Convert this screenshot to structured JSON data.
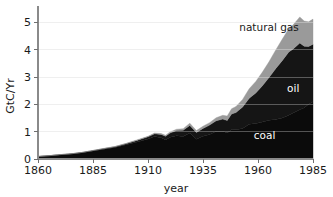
{
  "chart_data": {
    "type": "area",
    "title": "",
    "xlabel": "year",
    "ylabel": "GtC/Yr",
    "xlim": [
      1860,
      1985
    ],
    "ylim": [
      0,
      5.6
    ],
    "grid": true,
    "stacked": true,
    "legend": "inline-labels",
    "xticks": [
      1860,
      1885,
      1910,
      1935,
      1960,
      1985
    ],
    "xticklabels": [
      "1860",
      "1885",
      "1910",
      "1935",
      "1960",
      "1985"
    ],
    "yticks": [
      0,
      1,
      2,
      3,
      4,
      5
    ],
    "yticklabels": [
      "0",
      "1",
      "2",
      "3",
      "4",
      "5"
    ],
    "x": [
      1860,
      1865,
      1870,
      1875,
      1880,
      1885,
      1890,
      1895,
      1900,
      1905,
      1910,
      1913,
      1916,
      1918,
      1920,
      1923,
      1926,
      1929,
      1932,
      1935,
      1938,
      1941,
      1944,
      1946,
      1948,
      1950,
      1953,
      1956,
      1959,
      1962,
      1965,
      1968,
      1971,
      1974,
      1976,
      1979,
      1981,
      1983,
      1985
    ],
    "series": [
      {
        "name": "coal",
        "color": "#0b0b0b",
        "values": [
          0.09,
          0.12,
          0.15,
          0.18,
          0.23,
          0.29,
          0.36,
          0.42,
          0.52,
          0.62,
          0.73,
          0.82,
          0.78,
          0.7,
          0.8,
          0.85,
          0.82,
          0.95,
          0.72,
          0.83,
          0.9,
          1.02,
          1.02,
          0.95,
          1.08,
          1.07,
          1.12,
          1.27,
          1.3,
          1.35,
          1.42,
          1.45,
          1.5,
          1.6,
          1.68,
          1.8,
          1.88,
          2.0,
          2.1
        ]
      },
      {
        "name": "oil",
        "color": "#151515",
        "values": [
          0.0,
          0.0,
          0.01,
          0.01,
          0.01,
          0.02,
          0.02,
          0.03,
          0.04,
          0.06,
          0.08,
          0.1,
          0.12,
          0.13,
          0.15,
          0.19,
          0.23,
          0.28,
          0.25,
          0.29,
          0.34,
          0.38,
          0.44,
          0.46,
          0.57,
          0.63,
          0.78,
          0.95,
          1.12,
          1.33,
          1.56,
          1.85,
          2.1,
          2.32,
          2.35,
          2.45,
          2.25,
          2.12,
          2.1
        ]
      },
      {
        "name": "natural gas",
        "color": "#9a9a9a",
        "values": [
          0.0,
          0.0,
          0.0,
          0.0,
          0.0,
          0.0,
          0.01,
          0.01,
          0.01,
          0.02,
          0.02,
          0.03,
          0.03,
          0.04,
          0.04,
          0.05,
          0.06,
          0.08,
          0.07,
          0.08,
          0.09,
          0.11,
          0.14,
          0.16,
          0.19,
          0.22,
          0.28,
          0.35,
          0.42,
          0.5,
          0.58,
          0.68,
          0.78,
          0.85,
          0.88,
          0.95,
          0.92,
          0.9,
          0.92
        ]
      }
    ],
    "annotations": [
      {
        "text": "natural gas",
        "x": 1965,
        "y": 4.7,
        "anchor": "middle",
        "style": "dark-on-light"
      },
      {
        "text": "oil",
        "x": 1976,
        "y": 2.45,
        "anchor": "middle",
        "style": "light"
      },
      {
        "text": "coal",
        "x": 1963,
        "y": 0.75,
        "anchor": "middle",
        "style": "light"
      }
    ]
  },
  "axes": {
    "ylabel": "GtC/Yr",
    "xlabel": "year"
  }
}
